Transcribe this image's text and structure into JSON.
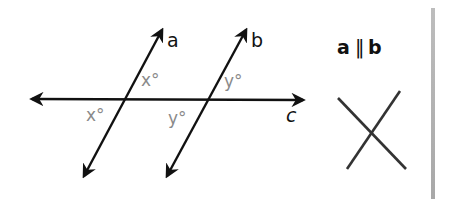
{
  "diagram": {
    "type": "parallel-lines-transversal",
    "lines": {
      "a": {
        "label": "a",
        "role": "parallel line"
      },
      "b": {
        "label": "b",
        "role": "parallel line"
      },
      "c": {
        "label": "c",
        "role": "transversal"
      }
    },
    "angle_labels": {
      "a_upper_right": "x°",
      "a_lower_left": "x°",
      "b_upper_right": "y°",
      "b_lower_left": "y°"
    },
    "relation": {
      "text_left": "a",
      "symbol": "‖",
      "text_right": "b"
    },
    "icon": "x-cross-icon",
    "colors": {
      "lines": "#111111",
      "angle_labels": "#8a8a8a",
      "edge_bar": "#b0b0b0"
    }
  }
}
